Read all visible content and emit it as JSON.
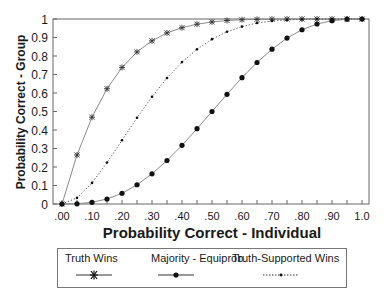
{
  "chart_data": {
    "type": "line",
    "title": "",
    "xlabel": "Probability Correct - Individual",
    "ylabel": "Probability Correct - Group",
    "xlim": [
      0,
      1
    ],
    "ylim": [
      0,
      1
    ],
    "grid": false,
    "legend_position": "bottom",
    "x_tick_labels": [
      ".00",
      ".10",
      ".20",
      ".30",
      ".40",
      ".50",
      ".60",
      ".70",
      ".80",
      ".90",
      "1.0"
    ],
    "y_tick_labels": [
      "0",
      "0.1",
      "0.2",
      "0.3",
      "0.4",
      "0.5",
      "0.6",
      "0.7",
      "0.8",
      "0.9",
      "1"
    ],
    "x": [
      0,
      0.05,
      0.1,
      0.15,
      0.2,
      0.25,
      0.3,
      0.35,
      0.4,
      0.45,
      0.5,
      0.55,
      0.6,
      0.65,
      0.7,
      0.75,
      0.8,
      0.85,
      0.9,
      0.95,
      1.0
    ],
    "series": [
      {
        "name": "Truth Wins",
        "marker": "asterisk",
        "line": "solid",
        "values": [
          0,
          0.265,
          0.469,
          0.623,
          0.738,
          0.822,
          0.882,
          0.925,
          0.953,
          0.972,
          0.984,
          0.992,
          0.996,
          0.998,
          0.999,
          1.0,
          1.0,
          1.0,
          1.0,
          1.0,
          1.0
        ]
      },
      {
        "name": "Majority - Equiprob.",
        "marker": "circle",
        "line": "solid",
        "values": [
          0,
          0.001,
          0.009,
          0.027,
          0.058,
          0.104,
          0.163,
          0.235,
          0.317,
          0.407,
          0.5,
          0.593,
          0.683,
          0.765,
          0.837,
          0.897,
          0.942,
          0.973,
          0.991,
          0.999,
          1.0
        ]
      },
      {
        "name": "Truth-Supported Wins",
        "marker": "small-dot",
        "line": "dotted",
        "values": [
          0,
          0.033,
          0.114,
          0.224,
          0.345,
          0.466,
          0.58,
          0.681,
          0.767,
          0.836,
          0.891,
          0.931,
          0.959,
          0.978,
          0.989,
          0.995,
          0.998,
          1.0,
          1.0,
          1.0,
          1.0
        ]
      }
    ]
  },
  "legend": {
    "items": [
      {
        "label": "Truth Wins"
      },
      {
        "label": "Majority - Equiprob."
      },
      {
        "label": "Truth-Supported Wins"
      }
    ]
  },
  "colors": {
    "axis": "#666666",
    "line": "#8a8a8a",
    "marker": "#111111",
    "text": "#1a1a1a"
  }
}
